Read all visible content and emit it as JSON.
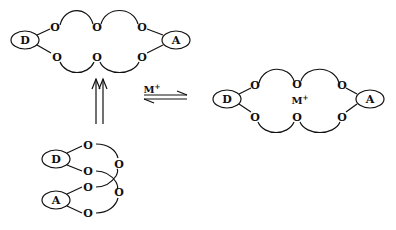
{
  "diagram": {
    "labels": {
      "donor": "D",
      "acceptor": "A",
      "oxygen": "O",
      "cation": "M",
      "cation_charge": "+"
    },
    "structures": [
      {
        "id": "open-cyclic",
        "position": "top-left",
        "oxygen_count": 6
      },
      {
        "id": "complexed",
        "position": "right",
        "oxygen_count": 6,
        "guest": "M+"
      },
      {
        "id": "folded-chain",
        "position": "bottom-left",
        "oxygen_count": 6
      }
    ],
    "arrows": [
      {
        "type": "double-up",
        "from": "folded-chain",
        "to": "open-cyclic"
      },
      {
        "type": "equilibrium",
        "label": "M+",
        "between": [
          "open-cyclic",
          "complexed"
        ]
      }
    ],
    "stroke_color": "#111111"
  }
}
